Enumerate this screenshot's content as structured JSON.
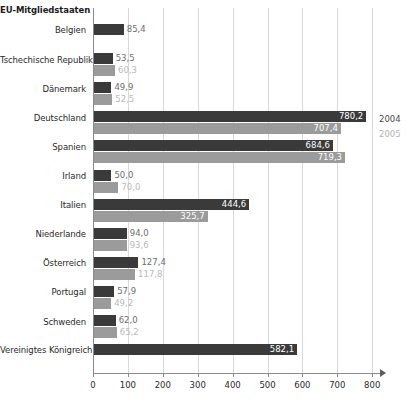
{
  "chart_data": {
    "type": "bar",
    "orientation": "horizontal",
    "title": "EU-Mitgliedstaaten",
    "xlabel": "",
    "ylabel": "EU-Mitgliedstaaten",
    "xlim": [
      0,
      800
    ],
    "xticks": [
      0,
      100,
      200,
      300,
      400,
      500,
      600,
      700,
      800
    ],
    "xtick_labels": [
      "0",
      "100",
      "200",
      "300",
      "400",
      "500",
      "600",
      "700",
      "800"
    ],
    "grid": true,
    "legend_position": "right",
    "decimal_separator": ",",
    "series": [
      {
        "name": "2004",
        "color": "#3a3a3a",
        "values": [
          85.4,
          53.5,
          49.9,
          780.2,
          684.6,
          50.0,
          444.6,
          94.0,
          127.4,
          57.9,
          62.0,
          582.1
        ],
        "labels": [
          "85,4",
          "53,5",
          "49,9",
          "780,2",
          "684,6",
          "50,0",
          "444,6",
          "94,0",
          "127,4",
          "57,9",
          "62,0",
          "582,1"
        ]
      },
      {
        "name": "2005",
        "color": "#9b9b9b",
        "values": [
          null,
          60.3,
          52.5,
          707.4,
          719.3,
          70.0,
          325.7,
          93.6,
          117.8,
          49.2,
          65.2,
          null
        ],
        "labels": [
          null,
          "60,3",
          "52,5",
          "707,4",
          "719,3",
          "70,0",
          "325,7",
          "93,6",
          "117,8",
          "49,2",
          "65,2",
          null
        ]
      }
    ],
    "categories": [
      "Belgien",
      "Tschechische Republik",
      "Dänemark",
      "Deutschland",
      "Spanien",
      "Irland",
      "Italien",
      "Niederlande",
      "Österreich",
      "Portugal",
      "Schweden",
      "Vereinigtes Königreich"
    ]
  },
  "legend": {
    "items": [
      {
        "label": "2004"
      },
      {
        "label": "2005"
      }
    ]
  }
}
